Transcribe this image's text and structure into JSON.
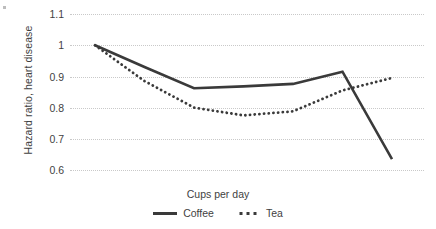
{
  "chart_data": {
    "type": "line",
    "title": "",
    "xlabel": "Cups per day",
    "ylabel": "Hazard ratio, heart disease",
    "x": [
      0,
      1,
      2,
      3,
      4,
      5,
      6
    ],
    "xtick_labels": [],
    "ytick_labels": [
      "1.1",
      "1",
      "0.9",
      "0.8",
      "0.7",
      "0.6"
    ],
    "ytick_values": [
      1.1,
      1.0,
      0.9,
      0.8,
      0.7,
      0.6
    ],
    "ylim": [
      0.6,
      1.1
    ],
    "grid": "horizontal-dotted",
    "legend_position": "bottom-center",
    "series": [
      {
        "name": "Coffee",
        "style": "solid",
        "color": "#3a3a3a",
        "values": [
          1.0,
          0.93,
          0.862,
          0.868,
          0.876,
          0.915,
          0.635
        ]
      },
      {
        "name": "Tea",
        "style": "dotted",
        "color": "#3a3a3a",
        "values": [
          1.0,
          0.885,
          0.8,
          0.775,
          0.788,
          0.855,
          0.895
        ]
      }
    ]
  },
  "axis": {
    "y_title": "Hazard ratio, heart disease",
    "x_title": "Cups per day",
    "ticks": [
      {
        "label": "1.1"
      },
      {
        "label": "1"
      },
      {
        "label": "0.9"
      },
      {
        "label": "0.8"
      },
      {
        "label": "0.7"
      },
      {
        "label": "0.6"
      }
    ]
  },
  "legend": {
    "items": [
      {
        "label": "Coffee",
        "style": "solid"
      },
      {
        "label": "Tea",
        "style": "dotted"
      }
    ]
  },
  "colors": {
    "series": "#3a3a3a",
    "gridline": "#c9c9c9",
    "text": "#3f3f3f",
    "background": "#ffffff"
  }
}
